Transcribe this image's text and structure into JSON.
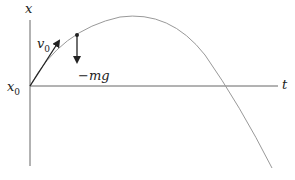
{
  "labels": {
    "y_axis": "x",
    "x_axis": "t",
    "origin": "x",
    "origin_sub": "0",
    "velocity": "v",
    "velocity_sub": "0",
    "force": "−mg"
  },
  "colors": {
    "axis": "#666666",
    "curve": "#999999",
    "arrow": "#222222"
  }
}
